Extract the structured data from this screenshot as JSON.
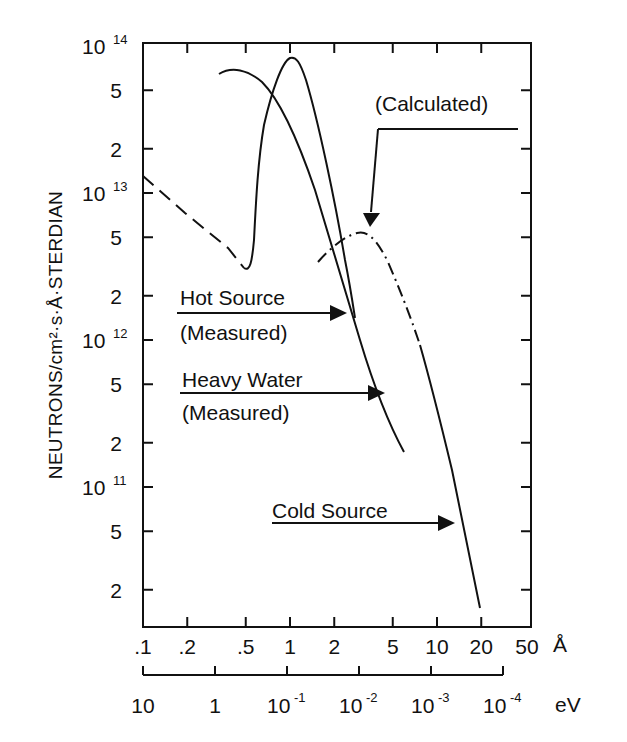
{
  "chart_data": {
    "type": "line",
    "title": "",
    "xlabel": "Å",
    "xlabel_secondary": "eV",
    "ylabel": "NEUTRONS/cm²·s·Å·STERDIAN",
    "xscale": "log",
    "yscale": "log",
    "xlim": [
      0.1,
      44
    ],
    "ylim": [
      11000000000.0,
      100000000000000.0
    ],
    "grid": false,
    "x_ticks": [
      ".1",
      ".2",
      ".5",
      "1",
      "2",
      "5",
      "10",
      "20",
      "50"
    ],
    "x_ticks_values": [
      0.1,
      0.2,
      0.5,
      1,
      2,
      5,
      10,
      20,
      50
    ],
    "x2_ticks": [
      {
        "base": "10",
        "exp": ""
      },
      {
        "base": "1",
        "exp": ""
      },
      {
        "base": "10",
        "exp": "-1"
      },
      {
        "base": "10",
        "exp": "-2"
      },
      {
        "base": "10",
        "exp": "-3"
      },
      {
        "base": "10",
        "exp": "-4"
      }
    ],
    "y_ticks": [
      {
        "base": "10",
        "exp": "14"
      },
      {
        "base": "5",
        "exp": ""
      },
      {
        "base": "2",
        "exp": ""
      },
      {
        "base": "10",
        "exp": "13"
      },
      {
        "base": "5",
        "exp": ""
      },
      {
        "base": "2",
        "exp": ""
      },
      {
        "base": "10",
        "exp": "12"
      },
      {
        "base": "5",
        "exp": ""
      },
      {
        "base": "2",
        "exp": ""
      },
      {
        "base": "10",
        "exp": "11"
      },
      {
        "base": "5",
        "exp": ""
      },
      {
        "base": "2",
        "exp": ""
      }
    ],
    "series": [
      {
        "name": "Hot Source (Measured)",
        "style": "solid",
        "x": [
          0.1,
          0.2,
          0.3,
          0.4,
          0.45,
          0.5,
          0.6,
          0.8,
          1.0,
          1.5,
          2.0,
          2.5,
          2.7
        ],
        "y": [
          13000000000000.0,
          6500000000000.0,
          4000000000000.0,
          3000000000000.0,
          2900000000000.0,
          3500000000000.0,
          25000000000000.0,
          55000000000000.0,
          78000000000000.0,
          60000000000000.0,
          25000000000000.0,
          5000000000000.0,
          2500000000000.0
        ],
        "note": "dashed extrapolation from 0.1 to 0.45 Å, solid measured portion 0.45–2.7 Å"
      },
      {
        "name": "Heavy Water (Measured)",
        "style": "solid",
        "x": [
          0.25,
          0.35,
          0.45,
          0.6,
          0.8,
          1.0,
          1.5,
          2.0,
          2.5,
          3.0,
          4.0,
          5.0,
          5.8
        ],
        "y": [
          60000000000000.0,
          66000000000000.0,
          63000000000000.0,
          50000000000000.0,
          30000000000000.0,
          18000000000000.0,
          6000000000000.0,
          2500000000000.0,
          1300000000000.0,
          750000000000.0,
          350000000000.0,
          200000000000.0,
          160000000000.0
        ]
      },
      {
        "name": "Calculated",
        "style": "dash-dot",
        "x": [
          1.6,
          2.0,
          2.5,
          3.0,
          3.5,
          4.0,
          5.0,
          6.0
        ],
        "y": [
          3500000000000.0,
          4500000000000.0,
          5200000000000.0,
          5400000000000.0,
          5000000000000.0,
          4000000000000.0,
          2000000000000.0,
          1000000000000.0
        ]
      },
      {
        "name": "Cold Source",
        "style": "solid",
        "x": [
          6.0,
          8.0,
          10.0,
          12.0,
          15.0,
          18.0,
          20.0
        ],
        "y": [
          1000000000000.0,
          450000000000.0,
          220000000000.0,
          110000000000.0,
          45000000000.0,
          20000000000.0,
          15000000000.0
        ]
      }
    ],
    "annotations": [
      {
        "text": "(Calculated)",
        "arrow_to": "Calculated peak"
      },
      {
        "text": "Hot Source",
        "sub": "(Measured)"
      },
      {
        "text": "Heavy Water",
        "sub": "(Measured)"
      },
      {
        "text": "Cold Source"
      }
    ]
  },
  "labels": {
    "ylabel": "NEUTRONS/cm²·s·Å·STERDIAN",
    "x_unit": "Å",
    "x2_unit": "eV",
    "calculated": "(Calculated)",
    "hot_source": "Hot Source",
    "hot_source_sub": "(Measured)",
    "heavy_water": "Heavy Water",
    "heavy_water_sub": "(Measured)",
    "cold_source": "Cold Source"
  }
}
